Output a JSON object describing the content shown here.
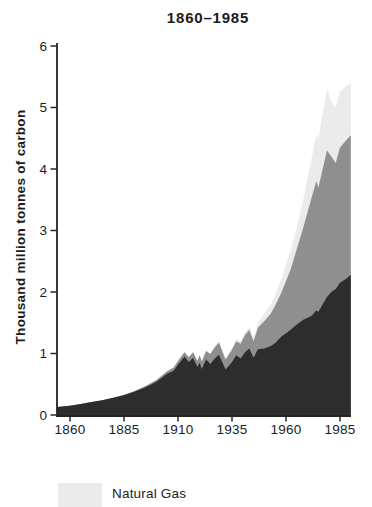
{
  "title": "1860–1985",
  "y_axis_title": "Thousand million tonnes of carbon",
  "legend": [
    {
      "label": "Natural Gas",
      "color": "#ebebeb"
    }
  ],
  "colors": {
    "axis": "#242424",
    "text": "#1c1c1c",
    "background": "#ffffff"
  },
  "chart_data": {
    "type": "area",
    "stacked": true,
    "title": "1860–1985",
    "xlabel": "",
    "ylabel": "Thousand million tonnes of carbon",
    "ylim": [
      0,
      6
    ],
    "xlim": [
      1854,
      1990
    ],
    "grid": false,
    "legend_position": "below-chart",
    "visible_legend_entries": [
      "Natural Gas"
    ],
    "y_ticks": [
      0,
      1,
      2,
      3,
      4,
      5,
      6
    ],
    "x_ticks": [
      1860,
      1885,
      1910,
      1935,
      1960,
      1985
    ],
    "years": [
      1854,
      1860,
      1865,
      1870,
      1875,
      1880,
      1885,
      1890,
      1895,
      1900,
      1905,
      1908,
      1910,
      1913,
      1915,
      1917,
      1919,
      1920,
      1921,
      1923,
      1925,
      1927,
      1929,
      1932,
      1935,
      1937,
      1939,
      1941,
      1943,
      1945,
      1947,
      1950,
      1953,
      1955,
      1958,
      1960,
      1962,
      1965,
      1968,
      1970,
      1972,
      1974,
      1975,
      1977,
      1979,
      1981,
      1983,
      1985,
      1988,
      1990
    ],
    "series": [
      {
        "name": "dark-band",
        "color": "#2d2d2d",
        "values": [
          0.13,
          0.15,
          0.18,
          0.21,
          0.24,
          0.28,
          0.32,
          0.38,
          0.45,
          0.54,
          0.67,
          0.72,
          0.82,
          0.95,
          0.86,
          0.93,
          0.78,
          0.85,
          0.75,
          0.9,
          0.83,
          0.92,
          0.98,
          0.74,
          0.86,
          0.97,
          0.92,
          1.02,
          1.08,
          0.93,
          1.07,
          1.08,
          1.12,
          1.17,
          1.28,
          1.33,
          1.38,
          1.47,
          1.55,
          1.58,
          1.62,
          1.7,
          1.68,
          1.8,
          1.92,
          2.0,
          2.05,
          2.15,
          2.22,
          2.28
        ]
      },
      {
        "name": "gray-band",
        "color": "#8f8f8f",
        "values": [
          0,
          0,
          0,
          0,
          0,
          0,
          0.01,
          0.01,
          0.02,
          0.03,
          0.04,
          0.05,
          0.06,
          0.07,
          0.08,
          0.09,
          0.1,
          0.12,
          0.12,
          0.14,
          0.16,
          0.18,
          0.2,
          0.16,
          0.2,
          0.23,
          0.24,
          0.28,
          0.3,
          0.27,
          0.35,
          0.45,
          0.53,
          0.61,
          0.72,
          0.85,
          0.97,
          1.23,
          1.5,
          1.72,
          1.93,
          2.1,
          2.02,
          2.2,
          2.38,
          2.2,
          2.05,
          2.2,
          2.25,
          2.27
        ]
      },
      {
        "name": "Natural Gas",
        "color": "#ebebeb",
        "values": [
          0,
          0,
          0,
          0,
          0,
          0,
          0,
          0,
          0,
          0,
          0.01,
          0.01,
          0.01,
          0.01,
          0.01,
          0.01,
          0.01,
          0.01,
          0.01,
          0.01,
          0.01,
          0.02,
          0.02,
          0.02,
          0.03,
          0.04,
          0.04,
          0.05,
          0.06,
          0.07,
          0.08,
          0.12,
          0.15,
          0.17,
          0.22,
          0.27,
          0.3,
          0.35,
          0.45,
          0.55,
          0.65,
          0.75,
          0.8,
          0.9,
          1.0,
          0.9,
          0.9,
          0.9,
          0.88,
          0.85
        ]
      }
    ]
  }
}
